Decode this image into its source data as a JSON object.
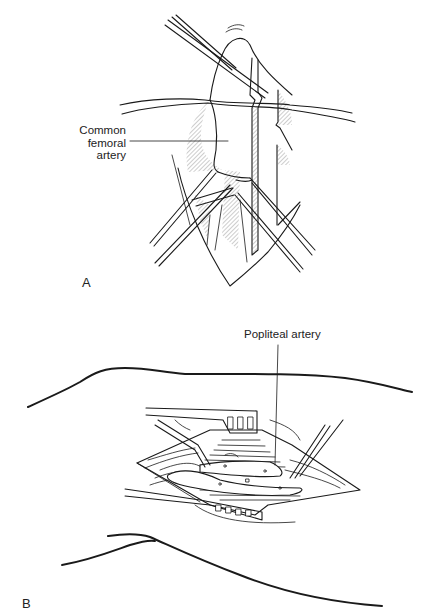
{
  "figure": {
    "panels": [
      {
        "id": "A",
        "letter": "A",
        "subject": "femoral exposure illustration",
        "labels": [
          {
            "text_lines": [
              "Common",
              "femoral",
              "artery"
            ],
            "target": "common femoral artery"
          }
        ]
      },
      {
        "id": "B",
        "letter": "B",
        "subject": "popliteal exposure illustration",
        "labels": [
          {
            "text": "Popliteal artery",
            "target": "popliteal artery"
          }
        ]
      }
    ],
    "colors": {
      "background": "#ffffff",
      "ink": "#1a1a1a"
    }
  }
}
